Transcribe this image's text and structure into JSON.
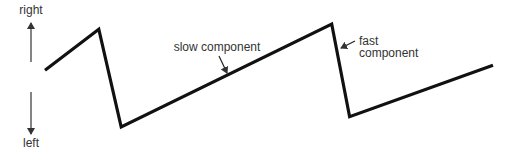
{
  "diagram": {
    "type": "sawtooth-trace",
    "labels": {
      "direction_up": "right",
      "direction_down": "left",
      "slow": "slow component",
      "fast_line1": "fast",
      "fast_line2": "component"
    },
    "trace_points": [
      {
        "t": 0.0,
        "v": 0.55
      },
      {
        "t": 0.12,
        "v": 0.95
      },
      {
        "t": 0.17,
        "v": 0.0
      },
      {
        "t": 0.64,
        "v": 1.0
      },
      {
        "t": 0.68,
        "v": 0.1
      },
      {
        "t": 1.0,
        "v": 0.6
      }
    ],
    "colors": {
      "trace": "#111111",
      "arrow": "#333333",
      "text": "#333333",
      "background": "#ffffff"
    }
  }
}
